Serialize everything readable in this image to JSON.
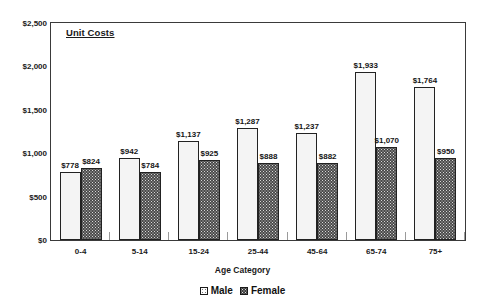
{
  "chart_data": {
    "type": "bar",
    "title": "Unit Costs",
    "xlabel": "Age Category",
    "ylabel": "",
    "ylim": [
      0,
      2500
    ],
    "ytick_step": 500,
    "yticks": [
      "$0",
      "$500",
      "$1,000",
      "$1,500",
      "$2,000",
      "$2,500"
    ],
    "ytick_values": [
      0,
      500,
      1000,
      1500,
      2000,
      2500
    ],
    "grid": false,
    "legend_position": "bottom-center",
    "categories": [
      "0-4",
      "5-14",
      "15-24",
      "25-44",
      "45-64",
      "65-74",
      "75+"
    ],
    "series": [
      {
        "name": "Male",
        "values": [
          778,
          942,
          1137,
          1287,
          1237,
          1933,
          1764
        ],
        "labels": [
          "$778",
          "$942",
          "$1,137",
          "$1,287",
          "$1,237",
          "$1,933",
          "$1,764"
        ],
        "fill": "light-dotted",
        "color": "#f4f4f4"
      },
      {
        "name": "Female",
        "values": [
          824,
          784,
          925,
          888,
          882,
          1070,
          950
        ],
        "labels": [
          "$824",
          "$784",
          "$925",
          "$888",
          "$882",
          "$1,070",
          "$950"
        ],
        "fill": "dark-dotted",
        "color": "#4a4a4a"
      }
    ]
  },
  "legend": {
    "items": [
      {
        "label": "Male",
        "marker": "male-swatch"
      },
      {
        "label": "Female",
        "marker": "female-swatch"
      }
    ]
  }
}
